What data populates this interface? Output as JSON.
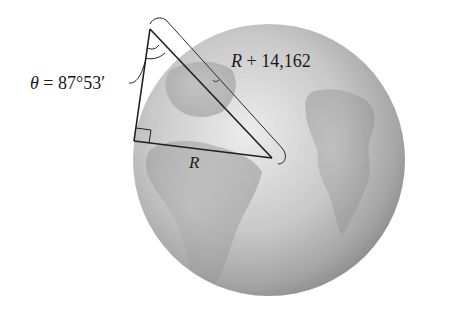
{
  "figure": {
    "labels": {
      "angle_symbol": "θ",
      "angle_equals": " = ",
      "angle_value": "87°53′",
      "hypotenuse_var": "R",
      "hypotenuse_rest": " + 14,162",
      "radius_var": "R"
    },
    "colors": {
      "globe_light": "#e6e6e6",
      "globe_mid": "#bdbdbd",
      "globe_dark": "#8e8e8e",
      "land": "#a3a3a3",
      "line": "#1f1f1f"
    },
    "geometry": {
      "globe_center": [
        269,
        160
      ],
      "globe_radius": 136,
      "observer_vertex": [
        150,
        29
      ],
      "right_angle_vertex": [
        134,
        141
      ],
      "earth_center_vertex": [
        272,
        158
      ]
    }
  }
}
